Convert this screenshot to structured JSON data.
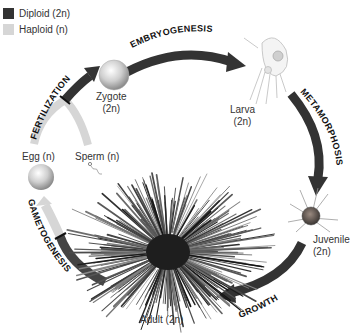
{
  "legend": {
    "items": [
      {
        "label": "Diploid (2n)",
        "color": "#333333"
      },
      {
        "label": "Haploid (n)",
        "color": "#d6d6d6"
      }
    ]
  },
  "stages": {
    "zygote": {
      "name": "Zygote",
      "ploidy": "(2n)"
    },
    "larva": {
      "name": "Larva",
      "ploidy": "(2n)"
    },
    "juvenile": {
      "name": "Juvenile",
      "ploidy": "(2n)"
    },
    "adult": {
      "label": "Adult (2n)"
    },
    "egg": {
      "label": "Egg (n)"
    },
    "sperm": {
      "label": "Sperm (n)"
    }
  },
  "processes": {
    "embryogenesis": "EMBRYOGENESIS",
    "metamorphosis": "METAMORPHOSIS",
    "growth": "GROWTH",
    "gametogenesis": "GAMETOGENESIS",
    "fertilization": "FERTILIZATION"
  },
  "colors": {
    "diploid_arrow": "#333333",
    "haploid_arrow": "#cfcfcf"
  }
}
